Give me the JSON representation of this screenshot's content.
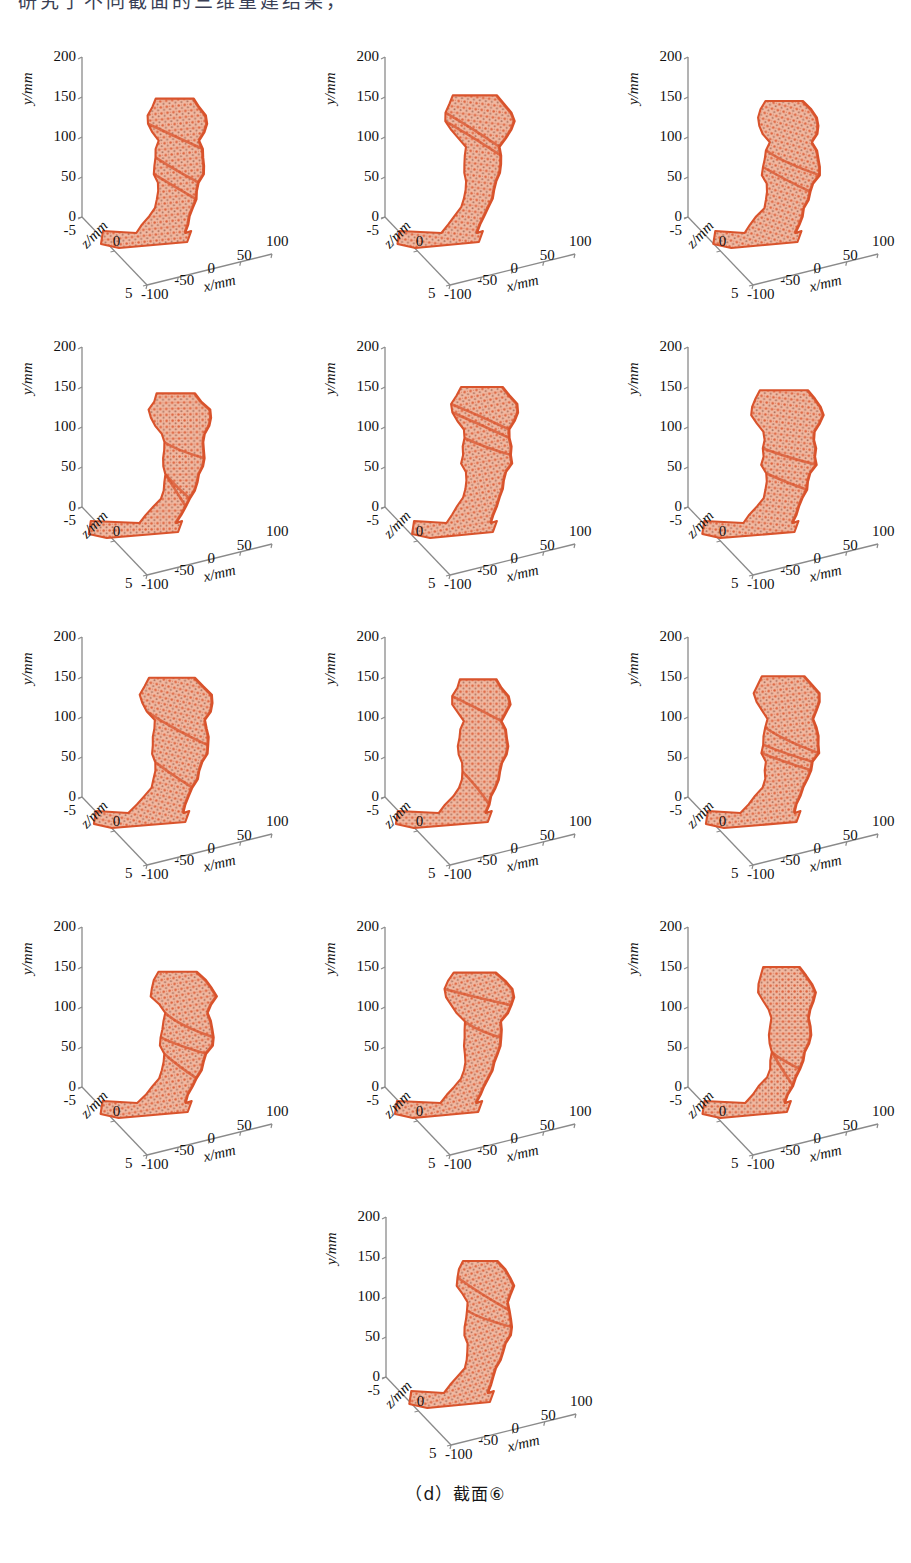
{
  "figure": {
    "caption": "（d）截面⑥",
    "panel_count": 13,
    "layout_rows": [
      3,
      3,
      3,
      3,
      1
    ],
    "top_clipped_text": "汉字标题被裁切"
  },
  "axes": {
    "y_label": "y/mm",
    "x_label": "x/mm",
    "z_label": "z/mm",
    "y_ticks": [
      "200",
      "150",
      "100",
      "50",
      "0",
      "-5"
    ],
    "y_tick_values": [
      200,
      150,
      100,
      50,
      0,
      -5
    ],
    "x_ticks": [
      "-100",
      "-50",
      "0",
      "50",
      "100"
    ],
    "x_tick_values": [
      -100,
      -50,
      0,
      50,
      100
    ],
    "z_ticks": [
      "5",
      "0",
      "-5"
    ],
    "z_tick_values": [
      5,
      0,
      -5
    ],
    "axis_color": "#8a8a8a",
    "text_color": "#111111"
  },
  "chart_data": {
    "type": "scatter",
    "title": "（d）截面⑥",
    "subtitle": "",
    "xlabel": "x/mm",
    "ylabel": "y/mm",
    "zlabel": "z/mm",
    "xlim": [
      -100,
      100
    ],
    "ylim": [
      -5,
      200
    ],
    "zlim": [
      -5,
      5
    ],
    "grid": false,
    "legend": "none",
    "projection": "3d",
    "series_color": "#d9532c",
    "panels": [
      {
        "index": 1,
        "row": 1,
        "col": 1,
        "label": "",
        "y_extent_mm": [
          -5,
          148
        ],
        "x_extent_mm": [
          -62,
          35
        ],
        "z_extent_mm": [
          -5,
          5
        ]
      },
      {
        "index": 2,
        "row": 1,
        "col": 2,
        "label": "",
        "y_extent_mm": [
          -5,
          152
        ],
        "x_extent_mm": [
          -70,
          32
        ],
        "z_extent_mm": [
          -5,
          5
        ]
      },
      {
        "index": 3,
        "row": 1,
        "col": 3,
        "label": "",
        "y_extent_mm": [
          -5,
          145
        ],
        "x_extent_mm": [
          -58,
          30
        ],
        "z_extent_mm": [
          -5,
          5
        ]
      },
      {
        "index": 4,
        "row": 2,
        "col": 1,
        "label": "",
        "y_extent_mm": [
          -5,
          142
        ],
        "x_extent_mm": [
          -60,
          40
        ],
        "z_extent_mm": [
          -5,
          5
        ]
      },
      {
        "index": 5,
        "row": 2,
        "col": 2,
        "label": "",
        "y_extent_mm": [
          -5,
          150
        ],
        "x_extent_mm": [
          -63,
          30
        ],
        "z_extent_mm": [
          -5,
          5
        ]
      },
      {
        "index": 6,
        "row": 2,
        "col": 3,
        "label": "",
        "y_extent_mm": [
          -5,
          146
        ],
        "x_extent_mm": [
          -60,
          38
        ],
        "z_extent_mm": [
          -5,
          5
        ]
      },
      {
        "index": 7,
        "row": 3,
        "col": 1,
        "label": "",
        "y_extent_mm": [
          -5,
          149
        ],
        "x_extent_mm": [
          -64,
          34
        ],
        "z_extent_mm": [
          -5,
          5
        ]
      },
      {
        "index": 8,
        "row": 3,
        "col": 2,
        "label": "",
        "y_extent_mm": [
          -5,
          147
        ],
        "x_extent_mm": [
          -58,
          33
        ],
        "z_extent_mm": [
          -5,
          5
        ]
      },
      {
        "index": 9,
        "row": 3,
        "col": 3,
        "label": "",
        "y_extent_mm": [
          -5,
          151
        ],
        "x_extent_mm": [
          -66,
          31
        ],
        "z_extent_mm": [
          -5,
          5
        ]
      },
      {
        "index": 10,
        "row": 4,
        "col": 1,
        "label": "",
        "y_extent_mm": [
          -5,
          144
        ],
        "x_extent_mm": [
          -61,
          36
        ],
        "z_extent_mm": [
          -5,
          5
        ]
      },
      {
        "index": 11,
        "row": 4,
        "col": 2,
        "label": "",
        "y_extent_mm": [
          -5,
          143
        ],
        "x_extent_mm": [
          -57,
          32
        ],
        "z_extent_mm": [
          -5,
          5
        ]
      },
      {
        "index": 12,
        "row": 4,
        "col": 3,
        "label": "",
        "y_extent_mm": [
          -5,
          150
        ],
        "x_extent_mm": [
          -62,
          37
        ],
        "z_extent_mm": [
          -5,
          5
        ]
      },
      {
        "index": 13,
        "row": 5,
        "col": 2,
        "label": "",
        "y_extent_mm": [
          -5,
          145
        ],
        "x_extent_mm": [
          -60,
          35
        ],
        "z_extent_mm": [
          -5,
          5
        ]
      }
    ]
  },
  "colors": {
    "mesh_primary": "#d9532c",
    "mesh_fill": "#f0b9a2",
    "mesh_speckle": "#7a3523",
    "axis": "#8a8a8a",
    "background": "#ffffff",
    "text": "#111111"
  }
}
